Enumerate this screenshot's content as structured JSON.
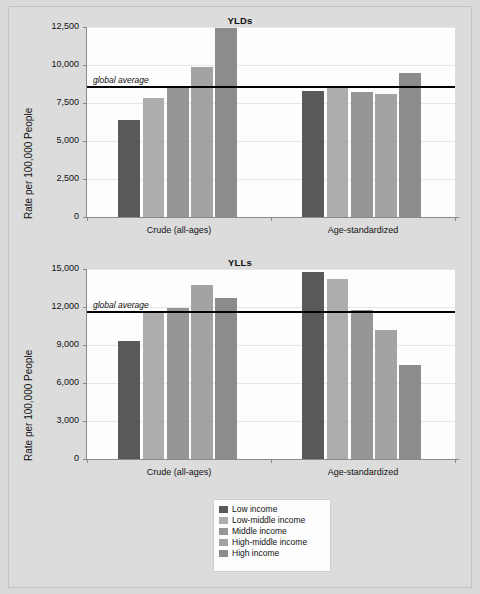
{
  "figure": {
    "background": "#d9d9d9",
    "plot_background": "#fdfdfd"
  },
  "series_colors": {
    "low": "#595959",
    "low_middle": "#adadad",
    "middle": "#969696",
    "high_middle": "#a3a3a3",
    "high": "#8c8c8c"
  },
  "legend": {
    "items": [
      {
        "label": "Low income",
        "color": "#595959"
      },
      {
        "label": "Low-middle income",
        "color": "#adadad"
      },
      {
        "label": "Middle income",
        "color": "#969696"
      },
      {
        "label": "High-middle income",
        "color": "#a3a3a3"
      },
      {
        "label": "High income",
        "color": "#8c8c8c"
      }
    ]
  },
  "chart_data": [
    {
      "type": "bar",
      "title": "YLDs",
      "xlabel": "",
      "ylabel": "Rate per 100,000 People",
      "ylim": [
        0,
        12500
      ],
      "yticks": [
        0,
        2500,
        5000,
        7500,
        10000,
        12500
      ],
      "ytick_labels": [
        "0",
        "2,500",
        "5,000",
        "7,500",
        "10,000",
        "12,500"
      ],
      "grid": true,
      "legend_position": "bottom",
      "categories": [
        "Crude (all-ages)",
        "Age-standardized"
      ],
      "series": [
        {
          "name": "Low income",
          "color": "#595959",
          "values": [
            6350,
            8300
          ]
        },
        {
          "name": "Low-middle income",
          "color": "#adadad",
          "values": [
            7850,
            8550
          ]
        },
        {
          "name": "Middle income",
          "color": "#969696",
          "values": [
            8600,
            8250
          ]
        },
        {
          "name": "High-middle income",
          "color": "#a3a3a3",
          "values": [
            9900,
            8100
          ]
        },
        {
          "name": "High income",
          "color": "#8c8c8c",
          "values": [
            12450,
            9500
          ]
        }
      ],
      "annotations": [
        {
          "name": "global-average",
          "label": "global average",
          "value": 8600
        }
      ]
    },
    {
      "type": "bar",
      "title": "YLLs",
      "xlabel": "",
      "ylabel": "Rate per 100,000 People",
      "ylim": [
        0,
        15000
      ],
      "yticks": [
        0,
        3000,
        6000,
        9000,
        12000,
        15000
      ],
      "ytick_labels": [
        "0",
        "3,000",
        "6,000",
        "9,000",
        "12,000",
        "15,000"
      ],
      "grid": true,
      "legend_position": "bottom",
      "categories": [
        "Crude (all-ages)",
        "Age-standardized"
      ],
      "series": [
        {
          "name": "Low income",
          "color": "#595959",
          "values": [
            9300,
            14800
          ]
        },
        {
          "name": "Low-middle income",
          "color": "#adadad",
          "values": [
            11650,
            14200
          ]
        },
        {
          "name": "Middle income",
          "color": "#969696",
          "values": [
            11950,
            11800
          ]
        },
        {
          "name": "High-middle income",
          "color": "#a3a3a3",
          "values": [
            13750,
            10200
          ]
        },
        {
          "name": "High income",
          "color": "#8c8c8c",
          "values": [
            12700,
            7450
          ]
        }
      ],
      "annotations": [
        {
          "name": "global-average",
          "label": "global average",
          "value": 11650
        }
      ]
    }
  ]
}
